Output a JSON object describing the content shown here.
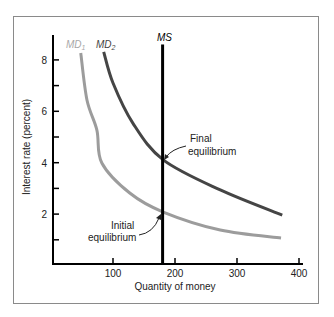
{
  "chart_data": {
    "type": "line",
    "title": "",
    "xlabel": "Quantity of money",
    "ylabel": "Interest rate (percent)",
    "xlim": [
      0,
      400
    ],
    "ylim": [
      0,
      9
    ],
    "grid": false,
    "legend": "none (inline curve labels)",
    "x_ticks": [
      100,
      200,
      300,
      400
    ],
    "x_tick_labels": [
      "100",
      "200",
      "300",
      "400"
    ],
    "y_ticks": [
      1,
      2,
      3,
      4,
      5,
      6,
      7,
      8
    ],
    "y_tick_labels": {
      "2": "2",
      "4": "4",
      "6": "6",
      "8": "8"
    },
    "series": [
      {
        "name": "MD1",
        "label_main": "MD",
        "label_sub": "1",
        "color": "#9c9c9c",
        "points": [
          [
            48,
            8.27
          ],
          [
            58,
            6.44
          ],
          [
            74,
            5.27
          ],
          [
            82,
            3.99
          ],
          [
            127,
            2.82
          ],
          [
            181,
            2.08
          ],
          [
            273,
            1.38
          ],
          [
            371,
            1.07
          ]
        ]
      },
      {
        "name": "MD2",
        "label_main": "MD",
        "label_sub": "2",
        "color": "#454545",
        "points": [
          [
            85,
            8.31
          ],
          [
            100,
            7.1
          ],
          [
            132,
            5.54
          ],
          [
            181,
            4.11
          ],
          [
            273,
            2.94
          ],
          [
            373,
            1.96
          ]
        ]
      },
      {
        "name": "MS",
        "label_main": "MS",
        "color": "#000000",
        "points": [
          [
            180,
            0
          ],
          [
            180,
            8.6
          ]
        ]
      }
    ],
    "annotations": [
      {
        "lines": [
          "Final",
          "equilibrium"
        ],
        "point": [
          180,
          4.1
        ]
      },
      {
        "lines": [
          "Initial",
          "equilibrium"
        ],
        "point": [
          180,
          2.1
        ]
      }
    ]
  }
}
